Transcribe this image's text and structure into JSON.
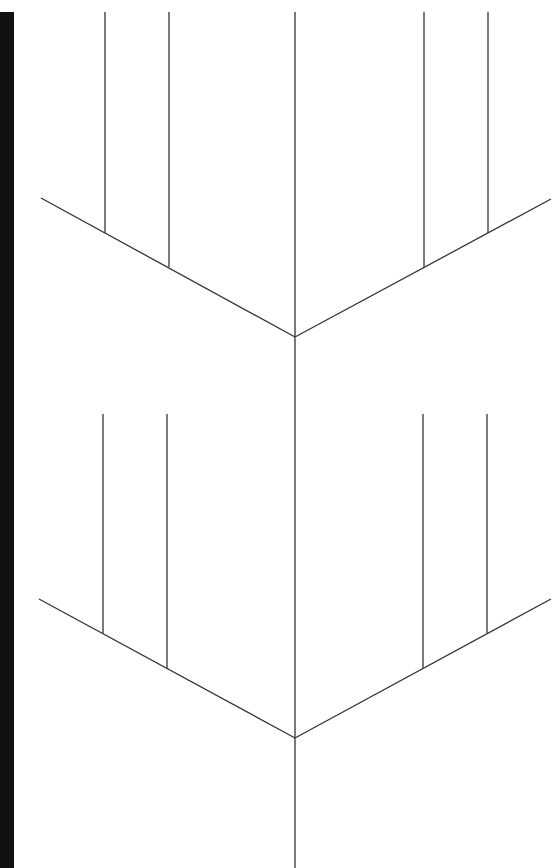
{
  "canvas": {
    "width": 555,
    "height": 868,
    "background": "#ffffff"
  },
  "edge_bar": {
    "x": 0,
    "y": 12,
    "width": 14,
    "height": 856,
    "color": "#111111"
  },
  "stroke_color": "#333333",
  "spine": {
    "x": 295,
    "y1": 12,
    "y2": 868
  },
  "groups": [
    {
      "name": "upper",
      "vertex": [
        295,
        337
      ],
      "left_arm_end": [
        41,
        198
      ],
      "right_arm_end": [
        551,
        199
      ],
      "left_verticals": [
        {
          "x": 105,
          "y1": 12,
          "y2": 233
        },
        {
          "x": 169,
          "y1": 12,
          "y2": 267
        }
      ],
      "right_verticals": [
        {
          "x": 424,
          "y1": 12,
          "y2": 267
        },
        {
          "x": 488,
          "y1": 12,
          "y2": 233
        }
      ]
    },
    {
      "name": "lower",
      "vertex": [
        295,
        738
      ],
      "left_arm_end": [
        39,
        599
      ],
      "right_arm_end": [
        551,
        599
      ],
      "left_verticals": [
        {
          "x": 103,
          "y1": 414,
          "y2": 634
        },
        {
          "x": 167,
          "y1": 414,
          "y2": 668
        }
      ],
      "right_verticals": [
        {
          "x": 423,
          "y1": 414,
          "y2": 668
        },
        {
          "x": 487,
          "y1": 414,
          "y2": 633
        }
      ]
    }
  ]
}
